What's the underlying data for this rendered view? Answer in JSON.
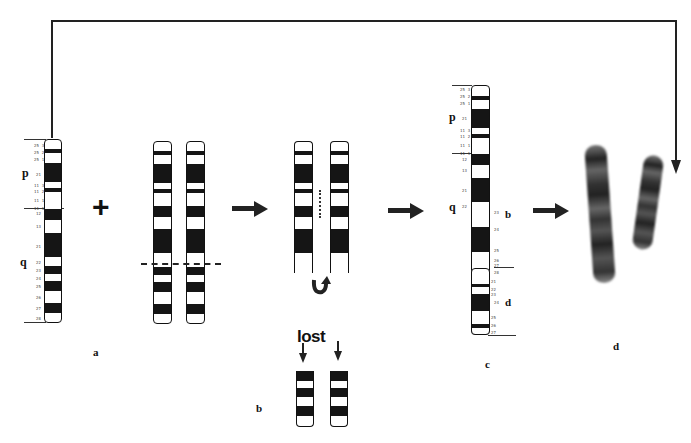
{
  "diagram": {
    "panel_labels": {
      "a": "a",
      "b": "b",
      "c": "c",
      "d": "d"
    },
    "arm_labels": {
      "p": "p",
      "q": "q"
    },
    "region_labels": {
      "b": "b",
      "d": "d"
    },
    "plus_sign": "+",
    "lost_label": "lost",
    "chromosome_a_band_ticks": [
      "25 3",
      "25 2",
      "25 1",
      "21",
      "11 3",
      "11 2",
      "11 1",
      "11 1",
      "12",
      "13",
      "21",
      "22",
      "23",
      "24",
      "25",
      "26",
      "27",
      "28"
    ],
    "chromosome_c_band_ticks": [
      "25 3",
      "25 2",
      "25 1",
      "21",
      "11 3",
      "11 2",
      "11 1",
      "11 1",
      "12",
      "13",
      "21",
      "22",
      "23",
      "24",
      "25",
      "26",
      "27",
      "28",
      "21",
      "22",
      "23",
      "24",
      "25",
      "26",
      "27",
      "28"
    ],
    "steps": [
      {
        "id": "a",
        "description": "normal chromosome with band ideogram"
      },
      {
        "id": "pair",
        "description": "paired chromosomes with dashed break line"
      },
      {
        "id": "exchange",
        "description": "sister chromatids with rotation arrow"
      },
      {
        "id": "b",
        "description": "lost fragments"
      },
      {
        "id": "c",
        "description": "rearranged chromosome ideogram"
      },
      {
        "id": "d",
        "description": "metaphase chromosome photographs"
      }
    ]
  },
  "colors": {
    "ink": "#151515",
    "background": "#ffffff"
  }
}
